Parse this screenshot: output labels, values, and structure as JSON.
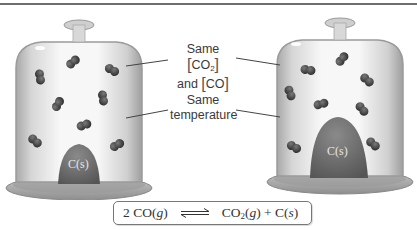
{
  "figure": {
    "top_rule": true,
    "left_jar": {
      "solid_label": "C(s)",
      "solid_size": "small",
      "molecule_count": 10
    },
    "right_jar": {
      "solid_label": "C(s)",
      "solid_size": "large",
      "molecule_count": 10
    },
    "callouts": {
      "concentration": {
        "line1_prefix": "Same",
        "line1_species": "CO",
        "line1_subscript": "2",
        "line2_prefix": "and",
        "line2_species": "CO"
      },
      "temperature": {
        "line1": "Same",
        "line2": "temperature"
      }
    },
    "equation": {
      "coefficient": "2",
      "reactant_species": "CO",
      "reactant_state": "g",
      "arrow": "equilibrium-harpoons",
      "product1_species": "CO",
      "product1_subscript": "2",
      "product1_state": "g",
      "plus": "+",
      "product2_species": "C",
      "product2_state": "s"
    },
    "colors": {
      "glass_edge": "#9a9a9a",
      "glass_fill": "#e9e9e9",
      "solid": "#6b6b6b",
      "molecule": "#4a4a4a",
      "leader_line": "#444444",
      "text": "#3a3a3a"
    }
  }
}
